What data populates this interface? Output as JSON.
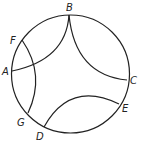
{
  "diagram": {
    "circle": {
      "cx": 70.5,
      "cy": 74,
      "r": 59
    },
    "points": [
      {
        "label": "B",
        "x": 69,
        "y": 15,
        "lx": 66,
        "ly": 11
      },
      {
        "label": "F",
        "x": 22,
        "y": 40,
        "lx": 10,
        "ly": 41
      },
      {
        "label": "A",
        "x": 12,
        "y": 71,
        "lx": 2,
        "ly": 75
      },
      {
        "label": "C",
        "x": 127,
        "y": 80,
        "lx": 130,
        "ly": 85
      },
      {
        "label": "E",
        "x": 119,
        "y": 104,
        "lx": 122,
        "ly": 112
      },
      {
        "label": "G",
        "x": 28,
        "y": 113,
        "lx": 17,
        "ly": 126
      },
      {
        "label": "D",
        "x": 44,
        "y": 127,
        "lx": 36,
        "ly": 140
      }
    ],
    "arcs": [
      {
        "from": "B",
        "to": "A"
      },
      {
        "from": "B",
        "to": "C"
      },
      {
        "from": "F",
        "to": "G"
      },
      {
        "from": "D",
        "to": "E"
      }
    ]
  }
}
